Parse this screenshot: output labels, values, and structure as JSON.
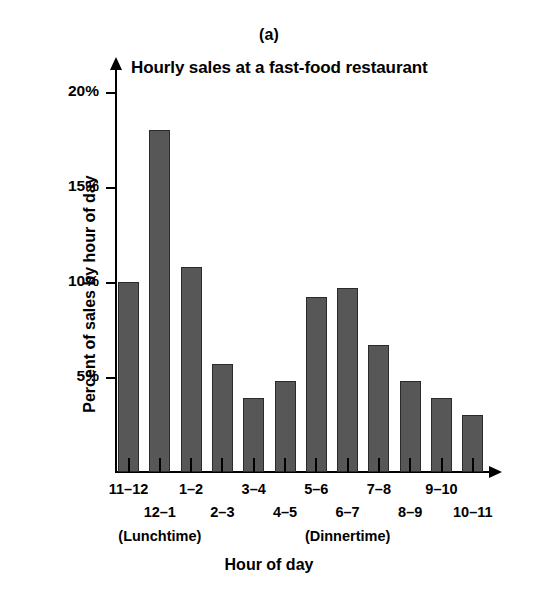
{
  "figure": {
    "panel_label": "(a)",
    "title": "Hourly sales at a fast-food restaurant",
    "xaxis_title": "Hour of day",
    "yaxis_title": "Percent of sales by hour of day"
  },
  "annotations": [
    {
      "text": "(Lunchtime)",
      "near_category": "12–1"
    },
    {
      "text": "(Dinnertime)",
      "near_category": "6–7"
    }
  ],
  "colors": {
    "bar_fill": "#575757",
    "bar_edge": "#2b2b2b",
    "axis": "#000000",
    "background": "#ffffff"
  },
  "chart_data": {
    "type": "bar",
    "title": "Hourly sales at a fast-food restaurant",
    "xlabel": "Hour of day",
    "ylabel": "Percent of sales by hour of day",
    "categories": [
      "11–12",
      "12–1",
      "1–2",
      "2–3",
      "3–4",
      "4–5",
      "5–6",
      "6–7",
      "7–8",
      "8–9",
      "9–10",
      "10–11"
    ],
    "values": [
      10.0,
      18.0,
      10.8,
      5.7,
      3.9,
      4.8,
      9.2,
      9.7,
      6.7,
      4.8,
      3.9,
      3.0
    ],
    "ylim": [
      0,
      21
    ],
    "yticks": [
      5,
      10,
      15,
      20
    ],
    "ytick_labels": [
      "5%",
      "10%",
      "15%",
      "20%"
    ],
    "grid": false,
    "legend": false,
    "units": "percent"
  }
}
